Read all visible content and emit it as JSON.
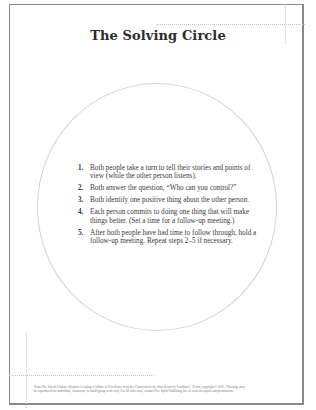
{
  "title": "The Solving Circle",
  "steps": [
    {
      "number": "1.",
      "text": "Both people take a turn to tell their stories and points of view (while the other person listens)."
    },
    {
      "number": "2.",
      "text": "Both answer the question, “Who can you control?”"
    },
    {
      "number": "3.",
      "text": "Both identify one positive thing about the other person."
    },
    {
      "number": "4.",
      "text": "Each person commits to doing one thing that will make things better. (Set a time for a follow-up meeting.)"
    },
    {
      "number": "5.",
      "text": "After both people have had time to follow through, hold a follow-up meeting. Repeat steps 2–5 if necessary."
    }
  ],
  "footer": {
    "line1": "From The School Climate Solution: Creating a Culture of Excellence from the Classroom to the Staff Room by Jonathan C. Erwin, copyright © 2015. This page may",
    "line2": "be reproduced for individual, classroom, or small-group work only. For all other uses, contact Free Spirit Publishing Inc. at www.freespirit.com/permissions."
  },
  "colors": {
    "frame": "#8a8a8a",
    "circle": "#d4d4d4",
    "text": "#3a3a3a",
    "crop_marks": "#c8c8c8"
  }
}
